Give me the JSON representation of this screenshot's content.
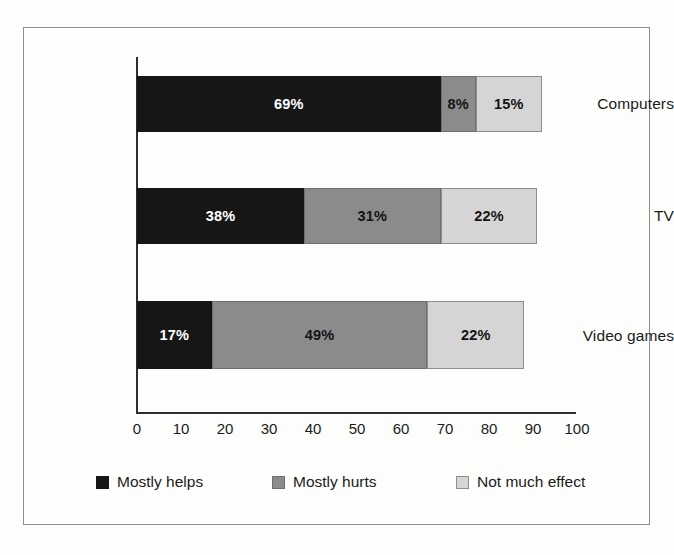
{
  "chart_data": {
    "type": "bar",
    "orientation": "horizontal",
    "stacked": true,
    "title": "",
    "subtitle": "",
    "xlabel": "",
    "ylabel": "",
    "xlim": [
      0,
      100
    ],
    "ylim": null,
    "grid": false,
    "legend_position": "bottom",
    "categories": [
      "Computers",
      "TV",
      "Video games"
    ],
    "xticks": [
      "0",
      "10",
      "20",
      "30",
      "40",
      "50",
      "60",
      "70",
      "80",
      "90",
      "100"
    ],
    "xtick_values": [
      0,
      10,
      20,
      30,
      40,
      50,
      60,
      70,
      80,
      90,
      100
    ],
    "series": [
      {
        "name": "Mostly helps",
        "color": "#161616",
        "values": [
          69,
          38,
          17
        ],
        "labels": [
          "69%",
          "38%",
          "17%"
        ]
      },
      {
        "name": "Mostly hurts",
        "color": "#8b8b8b",
        "values": [
          8,
          31,
          49
        ],
        "labels": [
          "8%",
          "31%",
          "49%"
        ]
      },
      {
        "name": "Not much effect",
        "color": "#d5d5d5",
        "values": [
          15,
          22,
          22
        ],
        "labels": [
          "15%",
          "22%",
          "22%"
        ]
      }
    ],
    "bars": [
      {
        "category": "Computers",
        "segments": [
          {
            "series": "Mostly helps",
            "value": 69,
            "label": "69%",
            "start": 0,
            "end": 69
          },
          {
            "series": "Mostly hurts",
            "value": 8,
            "label": "8%",
            "start": 69,
            "end": 77
          },
          {
            "series": "Not much effect",
            "value": 15,
            "label": "15%",
            "start": 77,
            "end": 92
          }
        ],
        "total": 92
      },
      {
        "category": "TV",
        "segments": [
          {
            "series": "Mostly helps",
            "value": 38,
            "label": "38%",
            "start": 0,
            "end": 38
          },
          {
            "series": "Mostly hurts",
            "value": 31,
            "label": "31%",
            "start": 38,
            "end": 69
          },
          {
            "series": "Not much effect",
            "value": 22,
            "label": "22%",
            "start": 69,
            "end": 91
          }
        ],
        "total": 91
      },
      {
        "category": "Video games",
        "segments": [
          {
            "series": "Mostly helps",
            "value": 17,
            "label": "17%",
            "start": 0,
            "end": 17
          },
          {
            "series": "Mostly hurts",
            "value": 49,
            "label": "49%",
            "start": 17,
            "end": 66
          },
          {
            "series": "Not much effect",
            "value": 22,
            "label": "22%",
            "start": 66,
            "end": 88
          }
        ],
        "total": 88
      }
    ]
  },
  "legend": {
    "items": [
      {
        "label": "Mostly helps",
        "swatch_color": "#161616"
      },
      {
        "label": "Mostly hurts",
        "swatch_color": "#8b8b8b"
      },
      {
        "label": "Not much effect",
        "swatch_color": "#d5d5d5"
      }
    ]
  },
  "axis": {
    "x_labels": [
      "0",
      "10",
      "20",
      "30",
      "40",
      "50",
      "60",
      "70",
      "80",
      "90",
      "100"
    ],
    "y_labels": [
      "Computers",
      "TV",
      "Video games"
    ]
  },
  "colors": {
    "mostly_helps": "#161616",
    "mostly_hurts": "#8b8b8b",
    "not_much_effect": "#d5d5d5",
    "axis": "#2d2d2d",
    "frame": "#8d8d8d",
    "background": "#fdfdfc"
  }
}
